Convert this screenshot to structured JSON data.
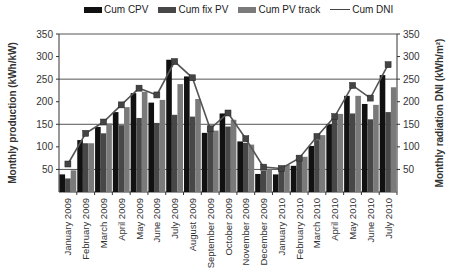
{
  "chart_data": {
    "type": "bar",
    "title": "",
    "xlabel": "",
    "ylabel": "Monthly production (kWh/kW)",
    "y2label": "Monthly radiation DNI (kWh/m²)",
    "ylim": [
      0,
      350
    ],
    "y2lim": [
      0,
      350
    ],
    "yticks": [
      50,
      100,
      150,
      200,
      250,
      300,
      350
    ],
    "y2ticks": [
      50,
      100,
      150,
      200,
      250,
      300,
      350
    ],
    "gridlines": [
      50,
      150,
      250,
      350
    ],
    "legend_position": "top",
    "categories": [
      "January 2009",
      "February 2009",
      "March 2009",
      "April 2009",
      "May 2009",
      "June 2009",
      "July 2009",
      "August 2009",
      "September 2009",
      "October 2009",
      "November 2009",
      "December 2009",
      "January 2010",
      "February 2010",
      "March 2010",
      "April 2010",
      "May 2010",
      "June 2010",
      "July 2010"
    ],
    "series": [
      {
        "name": "Cum CPV",
        "type": "bar",
        "color": "#111111",
        "values": [
          39,
          115,
          144,
          177,
          219,
          198,
          293,
          256,
          131,
          174,
          112,
          40,
          39,
          58,
          102,
          150,
          213,
          195,
          259
        ]
      },
      {
        "name": "Cum fix PV",
        "type": "bar",
        "color": "#474747",
        "values": [
          30,
          108,
          130,
          148,
          164,
          153,
          171,
          167,
          137,
          145,
          109,
          47,
          52,
          71,
          115,
          164,
          174,
          161,
          177
        ]
      },
      {
        "name": "Cum PV track",
        "type": "bar",
        "color": "#7a7a7a",
        "values": [
          48,
          108,
          152,
          188,
          222,
          204,
          239,
          206,
          136,
          160,
          105,
          50,
          60,
          78,
          126,
          173,
          213,
          193,
          232
        ]
      },
      {
        "name": "Cum DNI",
        "type": "line",
        "axis": "right",
        "color": "#555555",
        "values": [
          62,
          130,
          155,
          193,
          230,
          215,
          289,
          253,
          140,
          175,
          118,
          55,
          52,
          75,
          123,
          167,
          236,
          208,
          282
        ]
      }
    ]
  },
  "legend": {
    "items": [
      {
        "label": "Cum CPV"
      },
      {
        "label": "Cum fix PV"
      },
      {
        "label": "Cum PV track"
      },
      {
        "label": "Cum DNI"
      }
    ]
  }
}
